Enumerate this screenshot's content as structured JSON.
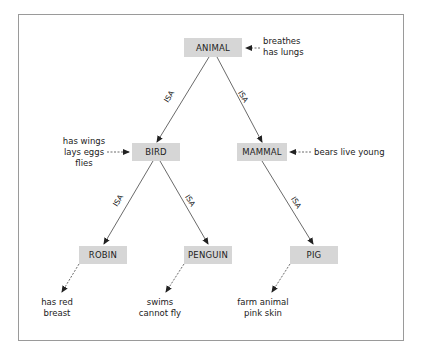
{
  "diagram": {
    "title": "",
    "relation_label": "ISA",
    "nodes": [
      {
        "id": "animal",
        "label": "ANIMAL",
        "properties": [
          "breathes",
          "has lungs"
        ]
      },
      {
        "id": "bird",
        "label": "BIRD",
        "properties": [
          "has wings",
          "lays eggs",
          "flies"
        ]
      },
      {
        "id": "mammal",
        "label": "MAMMAL",
        "properties": [
          "bears live young"
        ]
      },
      {
        "id": "robin",
        "label": "ROBIN",
        "properties": [
          "has red",
          "breast"
        ]
      },
      {
        "id": "penguin",
        "label": "PENGUIN",
        "properties": [
          "swims",
          "cannot fly"
        ]
      },
      {
        "id": "pig",
        "label": "PIG",
        "properties": [
          "farm animal",
          "pink skin"
        ]
      }
    ],
    "edges": [
      {
        "from": "animal",
        "to": "bird",
        "label": "ISA"
      },
      {
        "from": "animal",
        "to": "mammal",
        "label": "ISA"
      },
      {
        "from": "bird",
        "to": "robin",
        "label": "ISA"
      },
      {
        "from": "bird",
        "to": "penguin",
        "label": "ISA"
      },
      {
        "from": "mammal",
        "to": "pig",
        "label": "ISA"
      }
    ],
    "colors": {
      "node_fill": "#d6d6d6",
      "frame_border": "#9a9a9a",
      "line": "#444444"
    }
  }
}
